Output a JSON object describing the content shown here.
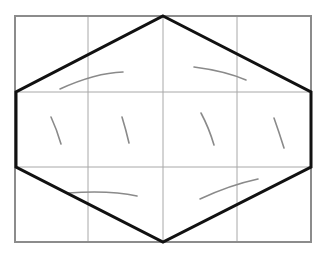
{
  "diagram": {
    "title": "",
    "grid": {
      "columns": 4,
      "rows": 3,
      "x_lines": [
        15,
        88,
        163,
        237,
        311
      ],
      "y_lines": [
        16,
        92,
        167,
        242
      ],
      "line_color": "#a8a8a8",
      "border_color": "#8c8c8c"
    },
    "hexagon": {
      "stroke_color": "#111111",
      "vertices": [
        [
          163,
          16
        ],
        [
          311,
          92
        ],
        [
          311,
          167
        ],
        [
          163,
          242
        ],
        [
          16,
          167
        ],
        [
          16,
          92
        ]
      ]
    },
    "marks": {
      "color": "#8a8a8a",
      "paths": [
        "M60 89 Q95 73 123 72",
        "M194 67 Q225 71 246 80",
        "M51 117 Q57 130 61 144",
        "M122 117 Q126 130 129 143",
        "M201 113 Q209 128 214 145",
        "M274 118 Q279 132 284 148",
        "M68 193 Q110 190 137 196",
        "M200 199 Q230 185 258 179"
      ]
    }
  }
}
